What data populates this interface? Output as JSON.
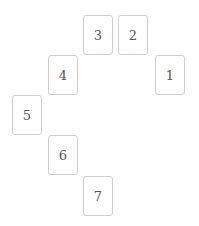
{
  "cards": [
    {
      "label": "1",
      "x": 155,
      "y": 55
    },
    {
      "label": "2",
      "x": 118,
      "y": 15
    },
    {
      "label": "3",
      "x": 83,
      "y": 15
    },
    {
      "label": "4",
      "x": 48,
      "y": 55
    },
    {
      "label": "5",
      "x": 12,
      "y": 95
    },
    {
      "label": "6",
      "x": 48,
      "y": 135
    },
    {
      "label": "7",
      "x": 83,
      "y": 176
    }
  ]
}
